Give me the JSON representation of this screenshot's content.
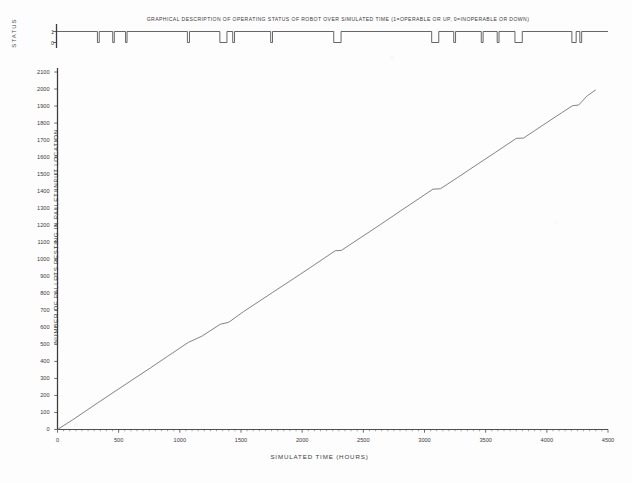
{
  "status_panel": {
    "title": "GRAPHICAL DESCRIPTION OF OPERATING STATUS OF ROBOT OVER SIMULATED TIME  (1=OPERABLE OR UP, 0=INOPERABLE OR DOWN)",
    "ylabel": "STATUS",
    "tick_up": "1",
    "tick_down": "0"
  },
  "main_panel": {
    "ylabel": "NUMBER OF PALLETS RESTING IN PALLET INPUT LOCATION",
    "xlabel": "SIMULATED TIME  (HOURS)"
  },
  "chart_data": [
    {
      "type": "line",
      "id": "robot-status-strip",
      "title": "GRAPHICAL DESCRIPTION OF OPERATING STATUS OF ROBOT OVER SIMULATED TIME  (1=OPERABLE OR UP, 0=INOPERABLE OR DOWN)",
      "xlabel": "",
      "ylabel": "STATUS",
      "xlim": [
        0,
        4500
      ],
      "ylim": [
        0,
        1
      ],
      "ytick_labels": [
        "1",
        "0"
      ],
      "ytick_values": [
        1,
        0
      ],
      "grid": false,
      "legend": null,
      "series": [
        {
          "name": "robot status (1=up, 0=down)",
          "description": "Step signal mostly at 1 with brief downtime intervals dropping to 0",
          "downtime_intervals": [
            [
              330,
              345
            ],
            [
              455,
              468
            ],
            [
              560,
              572
            ],
            [
              1065,
              1082
            ],
            [
              1330,
              1388
            ],
            [
              1435,
              1450
            ],
            [
              1745,
              1760
            ],
            [
              2260,
              2320
            ],
            [
              3060,
              3118
            ],
            [
              3240,
              3255
            ],
            [
              3465,
              3480
            ],
            [
              3595,
              3610
            ],
            [
              3740,
              3800
            ],
            [
              4205,
              4240
            ],
            [
              4270,
              4285
            ]
          ]
        }
      ]
    },
    {
      "type": "line",
      "id": "pallets-resting-vs-time",
      "title": "",
      "xlabel": "SIMULATED TIME  (HOURS)",
      "ylabel": "NUMBER OF PALLETS RESTING IN PALLET INPUT LOCATION",
      "xlim": [
        0,
        4500
      ],
      "ylim": [
        0,
        2100
      ],
      "xtick_labels": [
        "0",
        "500",
        "1000",
        "1500",
        "2000",
        "2500",
        "3000",
        "3500",
        "4000",
        "4500"
      ],
      "xtick_values": [
        0,
        500,
        1000,
        1500,
        2000,
        2500,
        3000,
        3500,
        4000,
        4500
      ],
      "ytick_labels": [
        "0",
        "100",
        "200",
        "300",
        "400",
        "500",
        "600",
        "700",
        "800",
        "900",
        "1000",
        "1100",
        "1200",
        "1300",
        "1400",
        "1500",
        "1600",
        "1700",
        "1800",
        "1900",
        "2000",
        "2100"
      ],
      "ytick_values": [
        0,
        100,
        200,
        300,
        400,
        500,
        600,
        700,
        800,
        900,
        1000,
        1100,
        1200,
        1300,
        1400,
        1500,
        1600,
        1700,
        1800,
        1900,
        2000,
        2100
      ],
      "grid": false,
      "legend": null,
      "series": [
        {
          "name": "Pallets resting in pallet input location",
          "x": [
            0,
            120,
            250,
            340,
            470,
            600,
            760,
            900,
            1070,
            1180,
            1330,
            1400,
            1520,
            1680,
            1760,
            1900,
            2060,
            2270,
            2320,
            2480,
            2640,
            2800,
            3070,
            3130,
            3270,
            3420,
            3580,
            3750,
            3810,
            3960,
            4120,
            4210,
            4260,
            4330,
            4400
          ],
          "y": [
            0,
            55,
            118,
            162,
            224,
            286,
            362,
            430,
            512,
            548,
            618,
            630,
            692,
            768,
            806,
            872,
            948,
            1050,
            1052,
            1128,
            1204,
            1282,
            1412,
            1414,
            1480,
            1552,
            1628,
            1710,
            1712,
            1784,
            1860,
            1902,
            1906,
            1960,
            1995
          ]
        }
      ]
    }
  ],
  "colors": {
    "ink": "#3a3a3a",
    "line": "#6d6d72",
    "paper": "#fdfdfd"
  }
}
